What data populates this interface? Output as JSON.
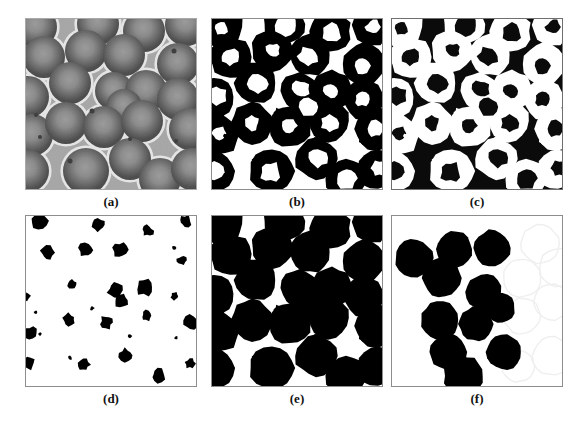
{
  "figure": {
    "caption_style": "lettered-subpanels",
    "rows": 2,
    "columns": 3,
    "background_color": "#ffffff"
  },
  "panels": [
    {
      "id": "a",
      "label": "(a)",
      "name": "original-grayscale-blood-smear",
      "description": "Original grayscale micrograph of red blood cells on a light gray background",
      "type": "grayscale-photo",
      "background_color": "#a8a8a8",
      "cell_fill_color": "#4a4a4a",
      "cell_core_color": "#8f8f8f",
      "halo_color": "#e8e8e8"
    },
    {
      "id": "b",
      "label": "(b)",
      "name": "binary-threshold-rings",
      "description": "Binarized image, cell membranes appear as black rings with white interiors on white background",
      "type": "binary",
      "background_color": "#ffffff",
      "foreground_color": "#000000"
    },
    {
      "id": "c",
      "label": "(c)",
      "name": "inverted-binary-rings",
      "description": "Complement of the binary image, white rings on a black background",
      "type": "binary-inverted",
      "background_color": "#0b0b0b",
      "foreground_color": "#ffffff"
    },
    {
      "id": "d",
      "label": "(d)",
      "name": "eroded-cell-markers",
      "description": "Erosion result leaving only small black marker blobs at the cell centers",
      "type": "binary",
      "background_color": "#ffffff",
      "foreground_color": "#000000"
    },
    {
      "id": "e",
      "label": "(e)",
      "name": "filled-cell-discs",
      "description": "Hole-filled binary image, each cell is a solid black disc",
      "type": "binary",
      "background_color": "#ffffff",
      "foreground_color": "#000000"
    },
    {
      "id": "f",
      "label": "(f)",
      "name": "border-cells-removed",
      "description": "Border-touching cells cleared, only the interior discs remain solid black, cleared cells shown as faint outlines",
      "type": "binary",
      "background_color": "#ffffff",
      "foreground_color": "#000000",
      "ghost_outline_color": "#f0f0f0"
    }
  ],
  "chart_data": {
    "type": "scatter",
    "title": "",
    "xlabel": "",
    "ylabel": "",
    "note": "Cell centre coordinates and radii are given in panel-local units (0-170) for a 170x170 field of view.",
    "cells_panel_a": [
      {
        "cx": 10,
        "cy": 8,
        "r": 21
      },
      {
        "cx": 72,
        "cy": 5,
        "r": 21
      },
      {
        "cx": 118,
        "cy": 12,
        "r": 21
      },
      {
        "cx": 160,
        "cy": 6,
        "r": 21
      },
      {
        "cx": 18,
        "cy": 38,
        "r": 21
      },
      {
        "cx": 60,
        "cy": 32,
        "r": 21
      },
      {
        "cx": 98,
        "cy": 36,
        "r": 21
      },
      {
        "cx": 152,
        "cy": 45,
        "r": 21
      },
      {
        "cx": 2,
        "cy": 78,
        "r": 21
      },
      {
        "cx": 44,
        "cy": 64,
        "r": 21
      },
      {
        "cx": 88,
        "cy": 72,
        "r": 19
      },
      {
        "cx": 120,
        "cy": 72,
        "r": 21
      },
      {
        "cx": 152,
        "cy": 80,
        "r": 21
      },
      {
        "cx": 98,
        "cy": 88,
        "r": 18
      },
      {
        "cx": 6,
        "cy": 116,
        "r": 21
      },
      {
        "cx": 40,
        "cy": 104,
        "r": 21
      },
      {
        "cx": 78,
        "cy": 108,
        "r": 21
      },
      {
        "cx": 116,
        "cy": 102,
        "r": 21
      },
      {
        "cx": 164,
        "cy": 110,
        "r": 21
      },
      {
        "cx": 2,
        "cy": 152,
        "r": 21
      },
      {
        "cx": 60,
        "cy": 152,
        "r": 23
      },
      {
        "cx": 104,
        "cy": 140,
        "r": 21
      },
      {
        "cx": 134,
        "cy": 160,
        "r": 21
      },
      {
        "cx": 166,
        "cy": 150,
        "r": 21
      }
    ],
    "debris_panel_a": [
      {
        "cx": 148,
        "cy": 32,
        "r": 2.5
      },
      {
        "cx": 66,
        "cy": 92,
        "r": 2.5
      },
      {
        "cx": 10,
        "cy": 96,
        "r": 2
      },
      {
        "cx": 14,
        "cy": 118,
        "r": 2
      },
      {
        "cx": 104,
        "cy": 120,
        "r": 2
      },
      {
        "cx": 44,
        "cy": 142,
        "r": 2.5
      },
      {
        "cx": 150,
        "cy": 122,
        "r": 2
      }
    ],
    "inner_marker_radius_ratio": 0.38,
    "ring_thickness_ratio": 0.42,
    "panel_f_kept_cells": [
      {
        "cx": 22,
        "cy": 42,
        "r": 19
      },
      {
        "cx": 62,
        "cy": 33,
        "r": 18
      },
      {
        "cx": 100,
        "cy": 32,
        "r": 18
      },
      {
        "cx": 50,
        "cy": 62,
        "r": 19
      },
      {
        "cx": 92,
        "cy": 76,
        "r": 18
      },
      {
        "cx": 108,
        "cy": 92,
        "r": 15
      },
      {
        "cx": 48,
        "cy": 104,
        "r": 19
      },
      {
        "cx": 84,
        "cy": 108,
        "r": 17
      },
      {
        "cx": 56,
        "cy": 136,
        "r": 18
      },
      {
        "cx": 112,
        "cy": 136,
        "r": 18
      },
      {
        "cx": 72,
        "cy": 160,
        "r": 20
      }
    ],
    "panel_f_cleared_cells": [
      {
        "cx": 148,
        "cy": 28,
        "r": 19
      },
      {
        "cx": 166,
        "cy": 52,
        "r": 19
      },
      {
        "cx": 130,
        "cy": 62,
        "r": 19
      },
      {
        "cx": 160,
        "cy": 86,
        "r": 18
      },
      {
        "cx": 130,
        "cy": 100,
        "r": 18
      },
      {
        "cx": 160,
        "cy": 140,
        "r": 19
      },
      {
        "cx": 126,
        "cy": 150,
        "r": 16
      }
    ]
  }
}
